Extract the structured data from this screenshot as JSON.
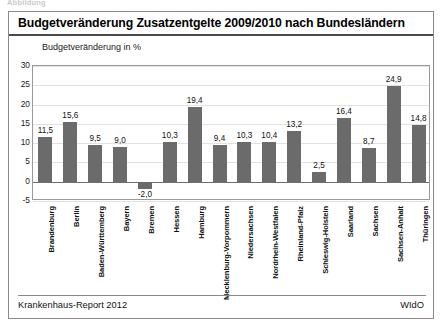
{
  "caption_cut": "Abbildung",
  "header": {
    "title": "Budgetveränderung Zusatzentgelte 2009/2010 nach Bundesländern"
  },
  "footer": {
    "left": "Krankenhaus-Report 2012",
    "right": "WIdO"
  },
  "chart_data": {
    "type": "bar",
    "title": "Budgetveränderung Zusatzentgelte 2009/2010 nach Bundesländern",
    "subtitle": "Budgetveränderung in %",
    "xlabel": "",
    "ylabel": "Budgetveränderung in %",
    "ylim": [
      -5,
      30
    ],
    "yticks": [
      30,
      25,
      20,
      15,
      10,
      5,
      0,
      -5
    ],
    "ytick_labels": [
      "30",
      "25",
      "20",
      "15",
      "10",
      "5",
      "0",
      "-5"
    ],
    "grid": true,
    "legend": false,
    "bar_color": "#6b6b6b",
    "categories": [
      "Brandenburg",
      "Berlin",
      "Baden-Württemberg",
      "Bayern",
      "Bremen",
      "Hessen",
      "Hamburg",
      "Mecklenburg-Vorpommern",
      "Niedersachsen",
      "Nordrhein-Westfalen",
      "Rheinland-Pfalz",
      "Schleswig-Holstein",
      "Saarland",
      "Sachsen",
      "Sachsen-Anhalt",
      "Thüringen"
    ],
    "values": [
      11.5,
      15.6,
      9.5,
      9.0,
      -2.0,
      10.3,
      19.4,
      9.4,
      10.3,
      10.4,
      13.2,
      2.5,
      16.4,
      8.7,
      24.9,
      14.8
    ],
    "value_labels": [
      "11,5",
      "15,6",
      "9,5",
      "9,0",
      "-2,0",
      "10,3",
      "19,4",
      "9,4",
      "10,3",
      "10,4",
      "13,2",
      "2,5",
      "16,4",
      "8,7",
      "24,9",
      "14,8"
    ]
  }
}
